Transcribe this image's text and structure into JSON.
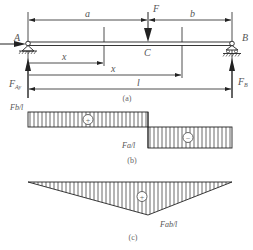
{
  "figure": {
    "panel_a": {
      "caption": "(a)",
      "labels": {
        "support_left": "A",
        "support_right": "B",
        "load_point": "C",
        "force": "F",
        "dim_a": "a",
        "dim_b": "b",
        "dim_x1": "x",
        "dim_x2": "x",
        "dim_l": "l",
        "reaction_left": "F",
        "reaction_left_sub": "Ay",
        "reaction_right": "F",
        "reaction_right_sub": "B"
      }
    },
    "panel_b": {
      "caption": "(b)",
      "title": "Shear force diagram",
      "labels": {
        "positive_value": "Fb/l",
        "negative_value": "Fa/l",
        "positive_sign": "+",
        "negative_sign": "−"
      }
    },
    "panel_c": {
      "caption": "(c)",
      "title": "Bending moment diagram",
      "labels": {
        "max_value": "Fab/l",
        "sign": "+"
      }
    }
  },
  "colors": {
    "line": "#222222",
    "hatch": "#444444",
    "text": "#555555"
  }
}
